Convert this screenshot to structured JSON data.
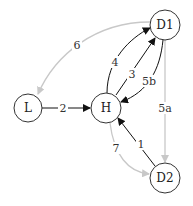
{
  "diagram": {
    "nodes": [
      {
        "id": "L",
        "label": "L"
      },
      {
        "id": "H",
        "label": "H"
      },
      {
        "id": "D1",
        "label": "D1"
      },
      {
        "id": "D2",
        "label": "D2"
      }
    ],
    "edges": [
      {
        "from": "L",
        "to": "H",
        "label": "2",
        "style": "dark"
      },
      {
        "from": "H",
        "to": "D1",
        "label": "4",
        "style": "dark"
      },
      {
        "from": "H",
        "to": "D1",
        "label": "3",
        "style": "dark"
      },
      {
        "from": "D1",
        "to": "H",
        "label": "5b",
        "style": "dark"
      },
      {
        "from": "D1",
        "to": "L",
        "label": "6",
        "style": "light"
      },
      {
        "from": "D1",
        "to": "D2",
        "label": "5a",
        "style": "light"
      },
      {
        "from": "H",
        "to": "D2",
        "label": "7",
        "style": "light"
      },
      {
        "from": "D2",
        "to": "H",
        "label": "1",
        "style": "dark"
      }
    ],
    "colors": {
      "dark_edge": "#111111",
      "light_edge": "#c8c8c8",
      "node_stroke": "#333333"
    }
  }
}
